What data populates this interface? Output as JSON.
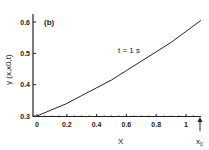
{
  "chart_data": {
    "type": "line",
    "panel_label": "(b)",
    "title": "",
    "xlabel": "X",
    "ylabel": "γ (x,x0,t)",
    "annotation": "t = 1 s",
    "x_marker_label": "x0",
    "xlim": [
      0,
      1.1
    ],
    "ylim": [
      0.3,
      0.62
    ],
    "x_ticks": [
      "0",
      "0.2",
      "0.4",
      "0.6",
      "0.8",
      "1"
    ],
    "y_ticks": [
      "0.3",
      "0.4",
      "0.5",
      "0.6"
    ],
    "grid": false,
    "series": [
      {
        "name": "t = 1 s",
        "x": [
          0,
          0.1,
          0.2,
          0.3,
          0.4,
          0.5,
          0.6,
          0.7,
          0.8,
          0.9,
          1.0,
          1.1
        ],
        "values": [
          0.3,
          0.32,
          0.34,
          0.365,
          0.39,
          0.415,
          0.445,
          0.475,
          0.505,
          0.535,
          0.57,
          0.605
        ]
      }
    ]
  }
}
